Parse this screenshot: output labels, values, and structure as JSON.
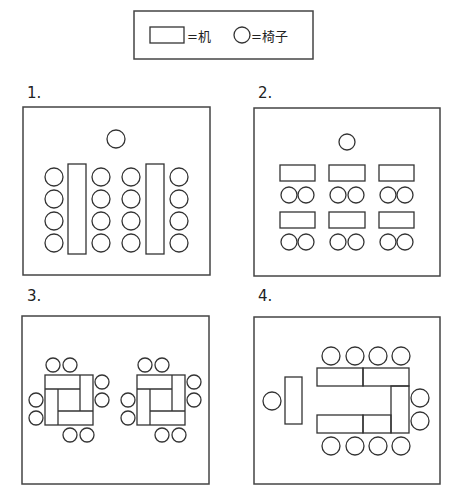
{
  "legend": {
    "desk_symbol": "rectangle",
    "desk_text": "=机",
    "chair_symbol": "circle",
    "chair_text": "=椅子"
  },
  "layouts": [
    {
      "label": "1.",
      "description": "Two long vertical tables, chairs on both sides (4 each side), one chair at front"
    },
    {
      "label": "2.",
      "description": "Six small tables in 2 rows x 3 columns, two chairs behind each, one chair at front"
    },
    {
      "label": "3.",
      "description": "Two pinwheel clusters of four tables, two chairs on each side"
    },
    {
      "label": "4.",
      "description": "U-shaped table arrangement with chairs around, separate table with one chair on the left"
    }
  ]
}
